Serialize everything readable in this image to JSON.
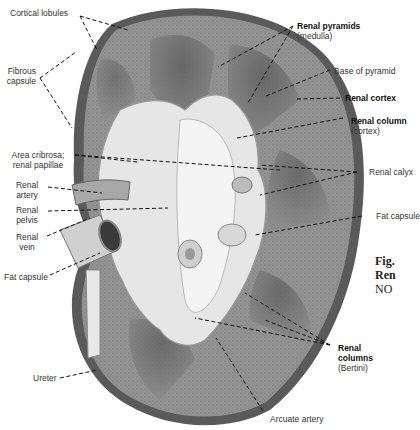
{
  "diagram": {
    "labels": {
      "cortical_lobules": "Cortical lobules",
      "fibrous_capsule": "Fibrous capsule",
      "area_cribrosa": "Area cribrosa; renal papillae",
      "renal_artery": "Renal artery",
      "renal_pelvis": "Renal pelvis",
      "renal_vein": "Renal vein",
      "fat_capsule_left": "Fat capsule",
      "ureter": "Ureter",
      "renal_pyramids": "Renal pyramids",
      "renal_pyramids_sub": "(medulla)",
      "base_of_pyramid": "Base of pyramid",
      "renal_cortex": "Renal cortex",
      "renal_column": "Renal column",
      "renal_column_sub": "(cortex)",
      "renal_calyx": "Renal calyx",
      "fat_capsule_right": "Fat capsule",
      "renal_columns": "Renal columns",
      "renal_columns_sub": "(Bertini)",
      "arcuate_artery": "Arcuate artery"
    },
    "caption": {
      "line1": "Fig.",
      "line2": "Ren",
      "line3": "NO"
    },
    "colors": {
      "tissue": "#8e8e8e",
      "medulla": "#6f6f6f",
      "sinus": "#e8e8e8",
      "capsule": "#5a5a5a",
      "leader": "#111111"
    }
  }
}
